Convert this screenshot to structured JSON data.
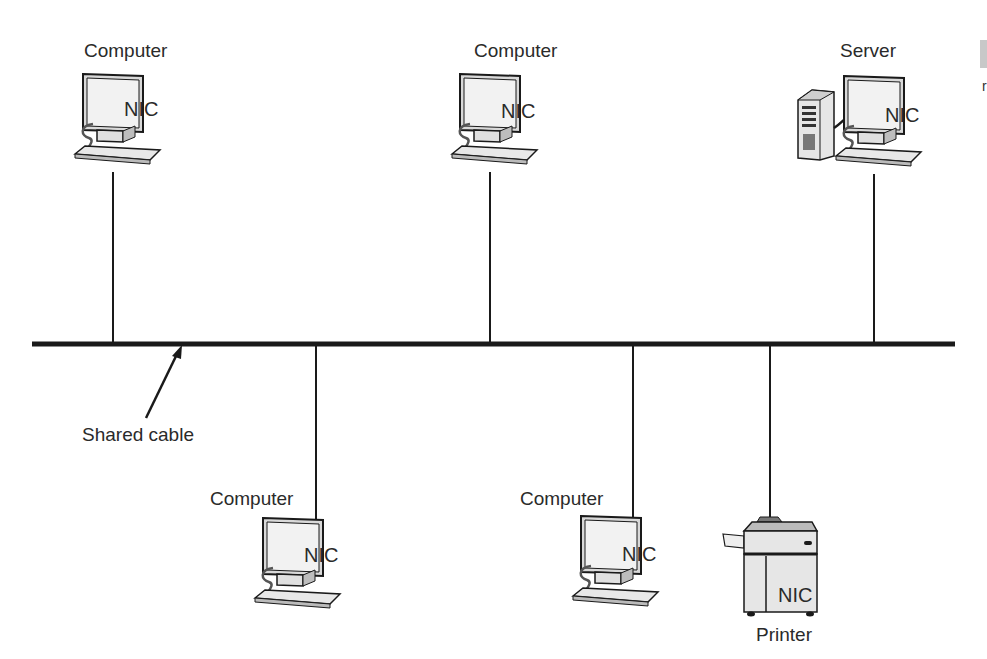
{
  "diagram": {
    "type": "bus-topology",
    "cable_label": "Shared cable",
    "nodes": [
      {
        "label": "Computer",
        "nic": "NIC",
        "position": "top-left"
      },
      {
        "label": "Computer",
        "nic": "NIC",
        "position": "top-center"
      },
      {
        "label": "Server",
        "nic": "NIC",
        "position": "top-right"
      },
      {
        "label": "Computer",
        "nic": "NIC",
        "position": "bottom-left"
      },
      {
        "label": "Computer",
        "nic": "NIC",
        "position": "bottom-center"
      },
      {
        "label": "Printer",
        "nic": "NIC",
        "position": "bottom-right"
      }
    ],
    "colors": {
      "line": "#1a1a1a",
      "fill": "#e6e6e6",
      "screen": "#f4f4f4"
    }
  },
  "edge": {
    "clipped_text": "r"
  }
}
